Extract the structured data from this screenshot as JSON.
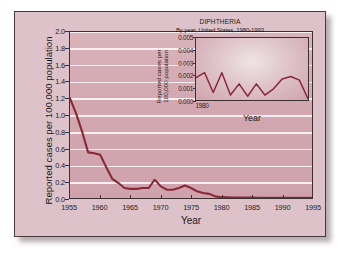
{
  "figure": {
    "background_color": "#ddc3c9",
    "border_color": "#4a3a3e"
  },
  "chart_data": [
    {
      "id": "main",
      "type": "line",
      "title": "",
      "xlabel": "Year",
      "ylabel": "Reported cases per 100,000 population",
      "xlim": [
        1955,
        1995
      ],
      "ylim": [
        0.0,
        2.0
      ],
      "xticks": [
        1955,
        1960,
        1965,
        1970,
        1975,
        1980,
        1985,
        1990,
        1995
      ],
      "xticklabels": [
        "1955",
        "1960",
        "1965",
        "1970",
        "1975",
        "1980",
        "1985",
        "1990",
        "1995"
      ],
      "yticks": [
        0.0,
        0.2,
        0.4,
        0.6,
        0.8,
        1.0,
        1.2,
        1.4,
        1.6,
        1.8,
        2.0
      ],
      "yticklabels": [
        "0.0",
        "0.2",
        "0.4",
        "0.6",
        "0.8",
        "1.0",
        "1.2",
        "1.4",
        "1.6",
        "1.8",
        "2.0"
      ],
      "grid": "horizontal",
      "grid_color": "#f6eef0",
      "line_color": "#8b2838",
      "plot_background": "#d2a7b0",
      "legend": "none",
      "x": [
        1955,
        1956,
        1957,
        1958,
        1959,
        1960,
        1961,
        1962,
        1963,
        1964,
        1965,
        1966,
        1967,
        1968,
        1969,
        1970,
        1971,
        1972,
        1973,
        1974,
        1975,
        1976,
        1977,
        1978,
        1979,
        1980,
        1981,
        1982,
        1983,
        1984,
        1985,
        1986,
        1987,
        1988,
        1989,
        1990,
        1991,
        1992,
        1993,
        1994,
        1995
      ],
      "y": [
        1.2,
        1.02,
        0.8,
        0.55,
        0.54,
        0.52,
        0.37,
        0.23,
        0.18,
        0.12,
        0.11,
        0.11,
        0.12,
        0.12,
        0.22,
        0.14,
        0.1,
        0.1,
        0.12,
        0.15,
        0.12,
        0.08,
        0.06,
        0.05,
        0.02,
        0.01,
        0.008,
        0.006,
        0.005,
        0.004,
        0.004,
        0.003,
        0.003,
        0.003,
        0.002,
        0.002,
        0.002,
        0.001,
        0.001,
        0.001,
        0.001
      ]
    },
    {
      "id": "inset",
      "type": "line",
      "title": "DIPHTHERIA",
      "subtitle": "By year, United States, 1980-1993",
      "xlabel": "Year",
      "ylabel": "Reported cases per 100,000 population",
      "xlim": [
        1980,
        1993
      ],
      "ylim": [
        0.0,
        0.005
      ],
      "xticks": [
        1980
      ],
      "xticklabels": [
        "1980"
      ],
      "yticks": [
        0.0,
        0.001,
        0.002,
        0.003,
        0.004,
        0.005
      ],
      "yticklabels": [
        "0.000",
        "0.001",
        "0.002",
        "0.003",
        "0.004",
        "0.005"
      ],
      "grid": "none",
      "line_color": "#8b2838",
      "plot_background": "#e0c7cd",
      "legend": "none",
      "x": [
        1980,
        1981,
        1982,
        1983,
        1984,
        1985,
        1986,
        1987,
        1988,
        1989,
        1990,
        1991,
        1992,
        1993
      ],
      "y": [
        0.0018,
        0.0022,
        0.0006,
        0.0022,
        0.0004,
        0.0013,
        0.0003,
        0.0013,
        0.0004,
        0.0009,
        0.0017,
        0.0019,
        0.0016,
        0.0001
      ]
    }
  ]
}
